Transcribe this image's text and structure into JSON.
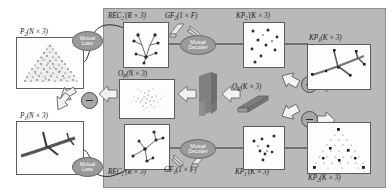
{
  "figure": {
    "type": "architecture-diagram",
    "domain": "point-cloud-keypoint-network",
    "background": "#ffffff",
    "panel_color": "#b9b9b9",
    "node_color": "#9a9a9a",
    "operator_color": "#a8a8a8"
  },
  "inputs": {
    "top": {
      "label": "P",
      "sub": "2",
      "dims": "(N × 3)",
      "content": "dense-triangular-point-cloud"
    },
    "bottom": {
      "label": "P",
      "sub": "1",
      "dims": "(N × 3)",
      "content": "airplane-point-cloud"
    }
  },
  "loss_nodes": [
    {
      "id": "mutual-loss-top",
      "line1": "Mutual",
      "line2": "Loss"
    },
    {
      "id": "mutual-loss-bottom",
      "line1": "Mutual",
      "line2": "Loss"
    }
  ],
  "decoder_nodes": [
    {
      "id": "mutual-decoder-top",
      "line1": "Mutual",
      "line2": "Decoder"
    },
    {
      "id": "mutual-decoder-bottom",
      "line1": "Mutual",
      "line2": "Decoder"
    }
  ],
  "reconstructions": {
    "top": {
      "label": "REC",
      "sub": "2",
      "prime": "′",
      "dims": "(R × 3)",
      "content": "skeleton-graph-top"
    },
    "bottom": {
      "label": "REC",
      "sub": "1",
      "prime": "′",
      "dims": "(R × 3)",
      "content": "skeleton-graph-bottom"
    }
  },
  "offsets": {
    "point": {
      "label": "O",
      "sub": "P",
      "dims": "(N × 3)",
      "content": "residual-noise-cloud"
    },
    "keypoint": {
      "label": "O",
      "sub": "K",
      "dims": "(K × 3)",
      "content": "tensor-slab-icon"
    }
  },
  "global_features": {
    "top": {
      "label": "GF",
      "sub": "2",
      "dims": "(1 × F)",
      "content": "feature-bar-icon"
    },
    "bottom": {
      "label": "GF",
      "sub": "1",
      "dims": "(1 × F)",
      "content": "feature-bar-icon"
    }
  },
  "keypoints_predicted": {
    "top": {
      "label": "KP",
      "sub": "2",
      "prime": "′",
      "dims": "(K × 3)",
      "content": "sparse-keypoints-top"
    },
    "bottom": {
      "label": "KP",
      "sub": "1",
      "prime": "′",
      "dims": "(K × 3)",
      "content": "sparse-keypoints-bottom"
    }
  },
  "keypoints_ground_truth": {
    "top": {
      "label": "KP",
      "sub": "1",
      "dims": "(K × 3)",
      "content": "airplane-with-keypoints"
    },
    "bottom": {
      "label": "KP",
      "sub": "2",
      "dims": "(K × 3)",
      "content": "triangular-cloud-with-keypoints"
    }
  },
  "encoder": {
    "id": "shared-encoder",
    "content": "stacked-conv-block-icon"
  },
  "operators": [
    {
      "id": "subtract-input",
      "symbol": "−",
      "role": "P2 minus P1 yields O_P"
    },
    {
      "id": "subtract-keypoint-top",
      "symbol": "−",
      "role": "KP1 minus O_K yields KP2'"
    },
    {
      "id": "subtract-keypoint-bot",
      "symbol": "−",
      "role": "KP2 minus O_K yields KP1'"
    }
  ]
}
